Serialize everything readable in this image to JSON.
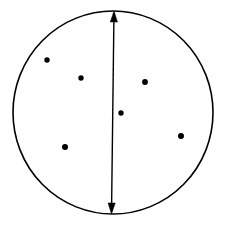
{
  "figure": {
    "canvas": {
      "width": 226,
      "height": 228,
      "background": "#ffffff"
    },
    "stroke_color": "#000000",
    "fill_color": "#000000",
    "circle": {
      "label": "circle-outline",
      "cx": 113,
      "cy": 112.5,
      "rx": 100,
      "ry": 101.5,
      "stroke_width": 1.6,
      "fill": "none"
    },
    "arrow": {
      "label": "double-headed-diameter-arrow",
      "x1": 114,
      "y1": 11,
      "x2": 111.5,
      "y2": 214,
      "stroke_width": 1.4,
      "head_length": 11,
      "head_half_width": 3.6,
      "heads": "both"
    },
    "points": [
      {
        "name": "point-1",
        "cx": 47,
        "cy": 60,
        "r": 2.7
      },
      {
        "name": "point-2",
        "cx": 81,
        "cy": 78,
        "r": 2.7
      },
      {
        "name": "point-3",
        "cx": 145,
        "cy": 82,
        "r": 2.9
      },
      {
        "name": "point-4",
        "cx": 121,
        "cy": 113,
        "r": 2.7
      },
      {
        "name": "point-5",
        "cx": 65,
        "cy": 147,
        "r": 3.0
      },
      {
        "name": "point-6",
        "cx": 181,
        "cy": 136,
        "r": 3.0
      }
    ]
  }
}
